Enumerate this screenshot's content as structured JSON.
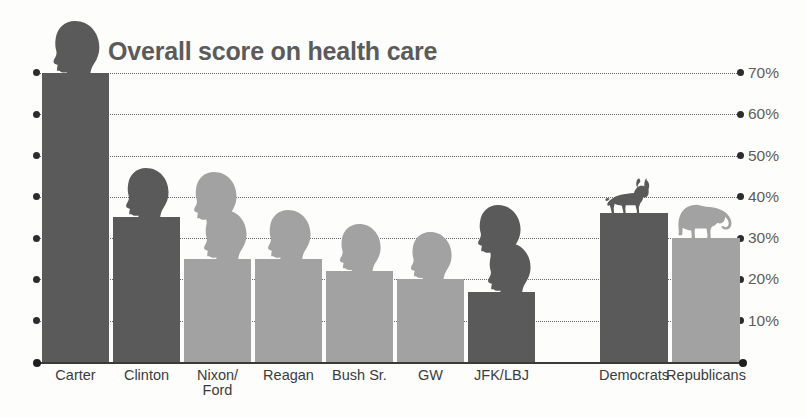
{
  "chart": {
    "title": "Overall score on health care",
    "axis_suffix": "%"
  },
  "chart_data": {
    "type": "bar",
    "title": "Overall score on health care",
    "xlabel": "",
    "ylabel": "",
    "ylim": [
      0,
      70
    ],
    "grid": true,
    "legend": "none",
    "ytick_labels": [
      "70%",
      "60%",
      "50%",
      "40%",
      "30%",
      "20%",
      "10%"
    ],
    "ytick_values": [
      70,
      60,
      50,
      40,
      30,
      20,
      10
    ],
    "categories": [
      "Carter",
      "Clinton",
      "Nixon/\nFord",
      "Reagan",
      "Bush Sr.",
      "GW",
      "JFK/LBJ",
      "Democrats",
      "Republicans"
    ],
    "values": [
      70,
      35,
      25,
      25,
      22,
      20,
      17,
      36,
      30
    ],
    "bar_colors": [
      "#5a5a5a",
      "#5a5a5a",
      "#a2a2a2",
      "#a2a2a2",
      "#a2a2a2",
      "#a2a2a2",
      "#5a5a5a",
      "#5a5a5a",
      "#a2a2a2"
    ],
    "bar_icons": [
      "head-silhouette",
      "head-silhouette",
      "head-silhouette-double",
      "head-silhouette",
      "head-silhouette",
      "head-silhouette",
      "head-silhouette-double",
      "donkey-silhouette",
      "elephant-silhouette"
    ]
  },
  "colors": {
    "dark_bar": "#5a5a5a",
    "light_bar": "#a2a2a2",
    "title": "#5b5b5b",
    "tick_text": "#5d5d5d",
    "axis": "#3a3a3a",
    "gridline": "#6a6a6a"
  }
}
